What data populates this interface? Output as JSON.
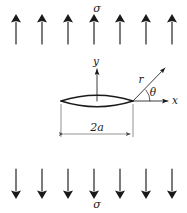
{
  "figure": {
    "background_color": "#ffffff",
    "line_color": "#1a1a1a",
    "thin_line_color": "#4a4a4a",
    "width": 187,
    "height": 213
  },
  "load_top": {
    "label": "σ",
    "label_x": 97,
    "label_y": 10,
    "arrow_count": 7,
    "direction": "up",
    "arrow_xs": [
      16,
      42,
      68,
      94,
      120,
      146,
      172
    ],
    "arrow_tail_y": 44,
    "arrow_head_y": 18
  },
  "load_bottom": {
    "label": "σ",
    "label_x": 97,
    "label_y": 205,
    "arrow_count": 7,
    "direction": "down",
    "arrow_xs": [
      16,
      42,
      68,
      94,
      120,
      146,
      172
    ],
    "arrow_tail_y": 169,
    "arrow_head_y": 195
  },
  "crack": {
    "shape": "lens",
    "left_tip_x": 61,
    "right_tip_x": 133,
    "center_x": 97,
    "center_y": 101,
    "half_opening": 7,
    "dimension_label": "2a",
    "dimension_label_x": 97,
    "dimension_label_y": 131,
    "dimension_line_y": 134,
    "dimension_from_x": 61,
    "dimension_to_x": 133
  },
  "axes": {
    "origin_x": 97,
    "origin_y": 101,
    "y_axis": {
      "label": "y",
      "label_x": 96,
      "label_y": 63,
      "tip_x": 97,
      "tip_y": 67
    },
    "x_axis": {
      "label": "x",
      "label_x": 175,
      "label_y": 104,
      "from_x": 133,
      "tip_x": 168,
      "tip_y": 101
    }
  },
  "polar": {
    "label_r": "r",
    "label_r_x": 141,
    "label_r_y": 80,
    "label_theta": "θ",
    "label_theta_x": 152,
    "label_theta_y": 93,
    "origin_x": 133,
    "origin_y": 101,
    "ray_tip_x": 165,
    "ray_tip_y": 68,
    "angle_degrees": 40,
    "arc_radius": 17
  }
}
